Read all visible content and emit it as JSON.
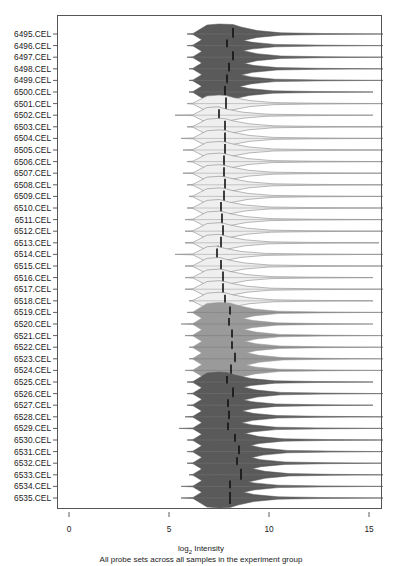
{
  "chart_data": {
    "type": "violin",
    "orientation": "horizontal",
    "title": "",
    "xlabel": "log2 Intensity",
    "xlabel_base": "log",
    "xlabel_sub": "2",
    "xlabel_rest": " Intensity",
    "subtitle": "All probe sets across all samples in the experiment group",
    "ylabel": "",
    "xlim": [
      -0.6,
      15.6
    ],
    "xticks": [
      0,
      5,
      10,
      15
    ],
    "xtick_labels": [
      "0",
      "5",
      "10",
      "15"
    ],
    "grid": false,
    "legend": null,
    "groups": [
      {
        "name": "group-1",
        "color": "#5a5a5a",
        "samples": [
          "6495.CEL",
          "6496.CEL",
          "6497.CEL",
          "6498.CEL",
          "6499.CEL",
          "6500.CEL"
        ]
      },
      {
        "name": "group-2",
        "color": "#efefef",
        "samples": [
          "6501.CEL",
          "6502.CEL",
          "6503.CEL",
          "6504.CEL",
          "6505.CEL",
          "6506.CEL",
          "6507.CEL",
          "6508.CEL",
          "6509.CEL",
          "6510.CEL",
          "6511.CEL",
          "6512.CEL",
          "6513.CEL",
          "6514.CEL",
          "6515.CEL",
          "6516.CEL",
          "6517.CEL",
          "6518.CEL"
        ]
      },
      {
        "name": "group-3",
        "color": "#9a9a9a",
        "samples": [
          "6519.CEL",
          "6520.CEL",
          "6521.CEL",
          "6522.CEL",
          "6523.CEL",
          "6524.CEL"
        ]
      },
      {
        "name": "group-4",
        "color": "#5a5a5a",
        "samples": [
          "6525.CEL",
          "6526.CEL",
          "6527.CEL",
          "6528.CEL",
          "6529.CEL",
          "6530.CEL",
          "6531.CEL",
          "6532.CEL",
          "6533.CEL",
          "6534.CEL",
          "6535.CEL"
        ]
      }
    ],
    "categories": [
      "6495.CEL",
      "6496.CEL",
      "6497.CEL",
      "6498.CEL",
      "6499.CEL",
      "6500.CEL",
      "6501.CEL",
      "6502.CEL",
      "6503.CEL",
      "6504.CEL",
      "6505.CEL",
      "6506.CEL",
      "6507.CEL",
      "6508.CEL",
      "6509.CEL",
      "6510.CEL",
      "6511.CEL",
      "6512.CEL",
      "6513.CEL",
      "6514.CEL",
      "6515.CEL",
      "6516.CEL",
      "6517.CEL",
      "6518.CEL",
      "6519.CEL",
      "6520.CEL",
      "6521.CEL",
      "6522.CEL",
      "6523.CEL",
      "6524.CEL",
      "6525.CEL",
      "6526.CEL",
      "6527.CEL",
      "6528.CEL",
      "6529.CEL",
      "6530.CEL",
      "6531.CEL",
      "6532.CEL",
      "6533.CEL",
      "6534.CEL",
      "6535.CEL"
    ],
    "series": [
      {
        "name": "median_log2_intensity",
        "values": [
          8.2,
          7.9,
          8.2,
          8.0,
          7.9,
          7.8,
          7.85,
          7.5,
          7.8,
          7.8,
          7.8,
          7.75,
          7.75,
          7.8,
          7.75,
          7.6,
          7.65,
          7.7,
          7.6,
          7.4,
          7.6,
          7.7,
          7.7,
          7.8,
          8.05,
          8.0,
          8.15,
          8.15,
          8.3,
          8.1,
          7.9,
          8.2,
          7.95,
          8.0,
          7.95,
          8.3,
          8.5,
          8.4,
          8.6,
          8.05,
          8.05
        ]
      },
      {
        "name": "min_log2_intensity",
        "values": [
          5.9,
          5.9,
          5.9,
          6.0,
          6.0,
          6.0,
          5.9,
          5.3,
          5.9,
          5.6,
          5.7,
          5.9,
          5.7,
          5.9,
          6.0,
          5.9,
          5.8,
          5.8,
          5.8,
          5.3,
          5.8,
          5.8,
          5.8,
          6.0,
          5.9,
          5.6,
          5.8,
          6.0,
          6.0,
          5.8,
          5.9,
          5.9,
          5.9,
          5.8,
          5.5,
          5.9,
          5.9,
          5.9,
          6.0,
          5.6,
          5.6
        ]
      },
      {
        "name": "max_log2_intensity",
        "values": [
          15.7,
          15.7,
          15.7,
          15.7,
          15.7,
          15.2,
          15.7,
          15.2,
          15.7,
          15.7,
          15.7,
          15.7,
          15.6,
          15.7,
          15.7,
          15.7,
          15.7,
          15.7,
          15.5,
          15.7,
          15.7,
          15.2,
          15.7,
          15.2,
          15.7,
          15.2,
          15.7,
          15.7,
          15.7,
          15.7,
          15.2,
          15.7,
          15.2,
          15.7,
          15.7,
          15.7,
          15.7,
          15.6,
          15.7,
          15.7,
          15.7
        ]
      }
    ]
  }
}
